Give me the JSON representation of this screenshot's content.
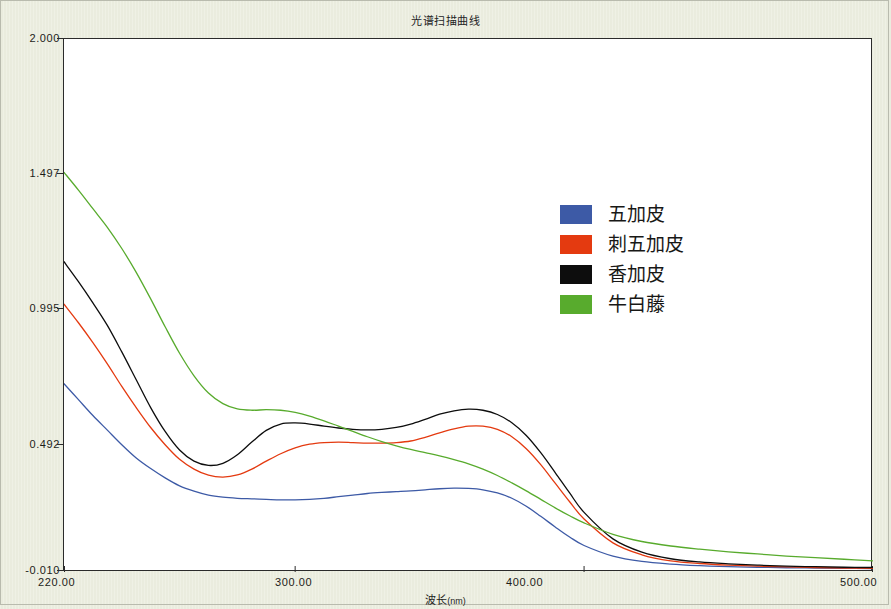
{
  "chart_title": "光谱扫描曲线",
  "axes": {
    "x_title": "波长",
    "x_unit": "(nm)",
    "x_ticks": [
      "220.00",
      "300.00",
      "400.00",
      "500.00"
    ],
    "y_ticks": [
      "2.000",
      "1.497",
      "0.995",
      "0.492",
      "-0.010"
    ]
  },
  "legend": {
    "items": [
      {
        "label": "五加皮",
        "color": "#3d5aa6"
      },
      {
        "label": "刺五加皮",
        "color": "#e43a10"
      },
      {
        "label": "香加皮",
        "color": "#0d0d0d"
      },
      {
        "label": "牛白藤",
        "color": "#58ab2d"
      }
    ]
  },
  "chart_data": {
    "type": "line",
    "title": "光谱扫描曲线",
    "xlabel": "波长 (nm)",
    "ylabel": "",
    "xlim": [
      220,
      500
    ],
    "ylim": [
      -0.01,
      2.0
    ],
    "grid": false,
    "legend_position": "center-right",
    "x": [
      220,
      225,
      230,
      235,
      240,
      245,
      250,
      255,
      260,
      265,
      270,
      275,
      280,
      285,
      290,
      295,
      300,
      305,
      310,
      315,
      320,
      325,
      330,
      335,
      340,
      345,
      350,
      355,
      360,
      365,
      370,
      375,
      380,
      385,
      390,
      395,
      400,
      410,
      420,
      430,
      440,
      450,
      460,
      470,
      480,
      490,
      500
    ],
    "series": [
      {
        "name": "五加皮",
        "color": "#3d5aa6",
        "values": [
          0.7,
          0.64,
          0.58,
          0.525,
          0.47,
          0.42,
          0.38,
          0.345,
          0.315,
          0.295,
          0.28,
          0.272,
          0.268,
          0.266,
          0.264,
          0.262,
          0.262,
          0.264,
          0.268,
          0.274,
          0.28,
          0.286,
          0.29,
          0.293,
          0.296,
          0.3,
          0.304,
          0.306,
          0.305,
          0.3,
          0.288,
          0.268,
          0.238,
          0.2,
          0.16,
          0.122,
          0.09,
          0.05,
          0.03,
          0.02,
          0.014,
          0.01,
          0.008,
          0.006,
          0.005,
          0.004,
          0.003
        ]
      },
      {
        "name": "刺五加皮",
        "color": "#e43a10",
        "values": [
          1.0,
          0.93,
          0.855,
          0.775,
          0.69,
          0.61,
          0.535,
          0.47,
          0.415,
          0.378,
          0.355,
          0.348,
          0.356,
          0.378,
          0.408,
          0.436,
          0.458,
          0.472,
          0.478,
          0.48,
          0.478,
          0.476,
          0.476,
          0.478,
          0.484,
          0.498,
          0.515,
          0.53,
          0.54,
          0.54,
          0.528,
          0.5,
          0.455,
          0.395,
          0.325,
          0.255,
          0.19,
          0.1,
          0.055,
          0.032,
          0.022,
          0.016,
          0.012,
          0.009,
          0.007,
          0.005,
          0.004
        ]
      },
      {
        "name": "香加皮",
        "color": "#0d0d0d",
        "values": [
          1.16,
          1.085,
          1.005,
          0.92,
          0.82,
          0.715,
          0.61,
          0.52,
          0.45,
          0.408,
          0.392,
          0.4,
          0.432,
          0.48,
          0.524,
          0.548,
          0.552,
          0.548,
          0.54,
          0.533,
          0.528,
          0.526,
          0.528,
          0.535,
          0.548,
          0.566,
          0.585,
          0.598,
          0.604,
          0.6,
          0.584,
          0.553,
          0.505,
          0.44,
          0.365,
          0.288,
          0.215,
          0.115,
          0.065,
          0.04,
          0.028,
          0.021,
          0.016,
          0.012,
          0.01,
          0.008,
          0.007
        ]
      },
      {
        "name": "牛白藤",
        "color": "#58ab2d",
        "values": [
          1.497,
          1.43,
          1.36,
          1.29,
          1.21,
          1.12,
          1.02,
          0.915,
          0.815,
          0.73,
          0.665,
          0.625,
          0.605,
          0.6,
          0.602,
          0.6,
          0.592,
          0.578,
          0.56,
          0.54,
          0.52,
          0.5,
          0.482,
          0.466,
          0.452,
          0.44,
          0.428,
          0.414,
          0.398,
          0.378,
          0.354,
          0.326,
          0.296,
          0.264,
          0.232,
          0.202,
          0.175,
          0.132,
          0.105,
          0.088,
          0.076,
          0.066,
          0.058,
          0.05,
          0.044,
          0.038,
          0.032
        ]
      }
    ]
  }
}
